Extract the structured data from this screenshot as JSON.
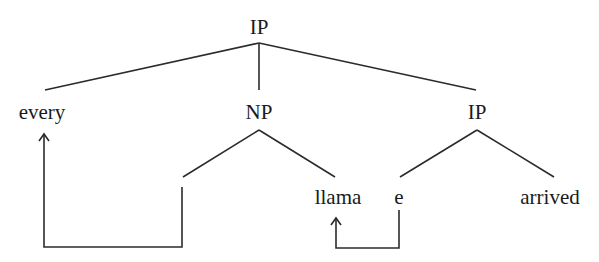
{
  "diagram": {
    "type": "syntax-tree",
    "nodes": {
      "root": {
        "label": "IP"
      },
      "det": {
        "label": "every"
      },
      "np": {
        "label": "NP"
      },
      "ip_inner": {
        "label": "IP"
      },
      "np_gap": {
        "label": ""
      },
      "noun": {
        "label": "llama"
      },
      "trace": {
        "label": "e"
      },
      "verb": {
        "label": "arrived"
      }
    },
    "edges": [
      {
        "from": "root",
        "to": "det"
      },
      {
        "from": "root",
        "to": "np"
      },
      {
        "from": "root",
        "to": "ip_inner"
      },
      {
        "from": "np",
        "to": "np_gap"
      },
      {
        "from": "np",
        "to": "noun"
      },
      {
        "from": "ip_inner",
        "to": "trace"
      },
      {
        "from": "ip_inner",
        "to": "verb"
      }
    ],
    "movement_arrows": [
      {
        "from": "np_gap",
        "to": "det",
        "description": "gap position raised to 'every'"
      },
      {
        "from": "trace",
        "to": "noun",
        "description": "trace 'e' linked to 'llama'"
      }
    ],
    "colors": {
      "line": "#2b2b2b",
      "text": "#1a1a1a",
      "background": "#ffffff"
    }
  }
}
